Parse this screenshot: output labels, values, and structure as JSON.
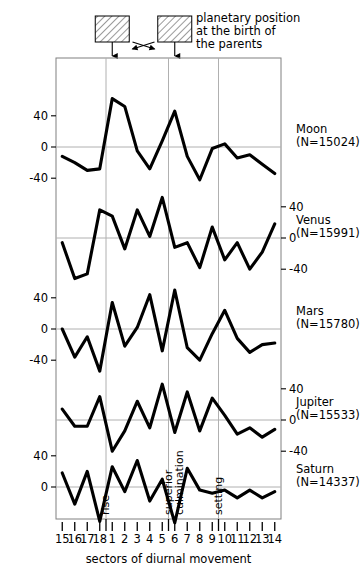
{
  "annotation": {
    "lines": [
      "planetary position",
      "at the birth of",
      "the parents"
    ],
    "marker_boxes": 2,
    "crossed_arrows": true
  },
  "axes": {
    "xlabel": "sectors of diurnal movement",
    "xticks": [
      "15",
      "16",
      "17",
      "18",
      "1",
      "2",
      "3",
      "4",
      "5",
      "6",
      "7",
      "8",
      "9",
      "10",
      "11",
      "12",
      "13",
      "14"
    ],
    "ytick_labels": [
      "40",
      "0",
      "-40"
    ],
    "gridline_labels": [
      "rise",
      "superior culmination",
      "setting"
    ],
    "grid": true
  },
  "chart_data": {
    "type": "line",
    "title": "",
    "xlabel": "sectors of diurnal movement",
    "ylabel": "",
    "x": [
      "15",
      "16",
      "17",
      "18",
      "1",
      "2",
      "3",
      "4",
      "5",
      "6",
      "7",
      "8",
      "9",
      "10",
      "11",
      "12",
      "13",
      "14"
    ],
    "ylim": [
      -60,
      70
    ],
    "yticks": [
      40,
      0,
      -40
    ],
    "vertical_gridlines_after": [
      "18",
      "5",
      "9"
    ],
    "gridline_annotations": [
      "rise",
      "superior culmination",
      "setting"
    ],
    "series": [
      {
        "name": "Moon",
        "label": "Moon",
        "count_label": "(N=15024)",
        "n": 15024,
        "values": [
          -12,
          -20,
          -30,
          -28,
          62,
          52,
          -5,
          -28,
          8,
          46,
          -12,
          -42,
          -2,
          4,
          -14,
          -10,
          -22,
          -34
        ]
      },
      {
        "name": "Venus",
        "label": "Venus",
        "count_label": "(N=15991)",
        "n": 15991,
        "values": [
          -6,
          -52,
          -46,
          36,
          28,
          -14,
          36,
          2,
          52,
          -12,
          -6,
          -38,
          14,
          -28,
          -6,
          -40,
          -18,
          18
        ]
      },
      {
        "name": "Mars",
        "label": "Mars",
        "count_label": "(N=15780)",
        "n": 15780,
        "values": [
          0,
          -36,
          -10,
          -54,
          34,
          -22,
          2,
          44,
          -28,
          50,
          -24,
          -40,
          -6,
          24,
          -12,
          -30,
          -20,
          -18
        ]
      },
      {
        "name": "Jupiter",
        "label": "Jupiter",
        "count_label": "(N=15533)",
        "n": 15533,
        "values": [
          14,
          -8,
          -8,
          30,
          -40,
          -14,
          24,
          -10,
          46,
          -16,
          36,
          -14,
          28,
          6,
          -18,
          -10,
          -22,
          -12
        ]
      },
      {
        "name": "Saturn",
        "label": "Saturn",
        "count_label": "(N=14337)",
        "n": 14337,
        "values": [
          18,
          -22,
          20,
          -44,
          26,
          -6,
          34,
          -18,
          10,
          -46,
          24,
          -4,
          -8,
          -4,
          -14,
          -4,
          -14,
          -6
        ]
      }
    ]
  },
  "colors": {
    "curve": "#000000",
    "grid": "#b0b0b0",
    "frame": "#808080",
    "hatch": "#555555"
  }
}
